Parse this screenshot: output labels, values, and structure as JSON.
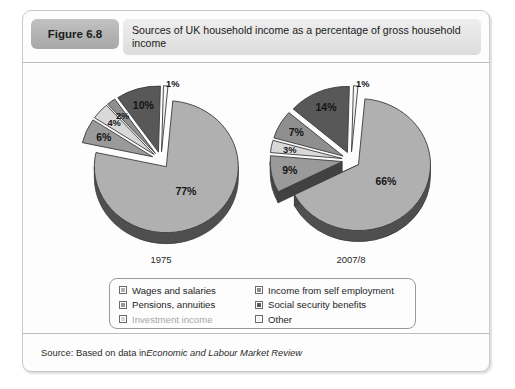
{
  "figure": {
    "badge_label": "Figure 6.8",
    "title": "Sources of UK household income as a percentage of gross household income",
    "source_prefix": "Source: Based on data in ",
    "source_italic": "Economic and Labour Market Review"
  },
  "legend": {
    "column1": [
      {
        "label": "Wages and salaries",
        "color": "#b0b0b0",
        "faint": false
      },
      {
        "label": "Pensions, annuities",
        "color": "#9a9a9a",
        "faint": false
      },
      {
        "label": "Investment income",
        "color": "#d8d8d8",
        "faint": true
      }
    ],
    "column2": [
      {
        "label": "Income from self employment",
        "color": "#8f8f8f",
        "faint": false
      },
      {
        "label": "Social security benefits",
        "color": "#585858",
        "faint": false
      },
      {
        "label": "Other",
        "color": "#f4f4f4",
        "faint": false
      }
    ]
  },
  "chart_data": {
    "type": "pie",
    "title": "Sources of UK household income as a percentage of gross household income",
    "unit": "%",
    "categories": [
      "Wages and salaries",
      "Pensions, annuities",
      "Investment income",
      "Income from self employment",
      "Social security benefits",
      "Other"
    ],
    "colors": [
      "#b0b0b0",
      "#9a9a9a",
      "#d8d8d8",
      "#8f8f8f",
      "#585858",
      "#f4f4f4"
    ],
    "series": [
      {
        "name": "1975",
        "values": [
          77,
          6,
          4,
          2,
          10,
          1
        ],
        "labels": [
          "77%",
          "6%",
          "4%",
          "2%",
          "10%",
          "1%"
        ]
      },
      {
        "name": "2007/8",
        "values": [
          66,
          9,
          3,
          7,
          14,
          1
        ],
        "labels": [
          "66%",
          "9%",
          "3%",
          "7%",
          "14%",
          "1%"
        ]
      }
    ],
    "legend_position": "bottom",
    "grid": false
  },
  "pies": [
    {
      "year_label": "1975",
      "slices": [
        {
          "label": "77%",
          "value": 77,
          "color": "#b0b0b0"
        },
        {
          "label": "6%",
          "value": 6,
          "color": "#9a9a9a"
        },
        {
          "label": "4%",
          "value": 4,
          "color": "#d8d8d8"
        },
        {
          "label": "2%",
          "value": 2,
          "color": "#8f8f8f"
        },
        {
          "label": "10%",
          "value": 10,
          "color": "#585858"
        },
        {
          "label": "1%",
          "value": 1,
          "color": "#f4f4f4"
        }
      ]
    },
    {
      "year_label": "2007/8",
      "slices": [
        {
          "label": "66%",
          "value": 66,
          "color": "#b0b0b0"
        },
        {
          "label": "9%",
          "value": 9,
          "color": "#9a9a9a"
        },
        {
          "label": "3%",
          "value": 3,
          "color": "#d8d8d8"
        },
        {
          "label": "7%",
          "value": 7,
          "color": "#8f8f8f"
        },
        {
          "label": "14%",
          "value": 14,
          "color": "#585858"
        },
        {
          "label": "1%",
          "value": 1,
          "color": "#f4f4f4"
        }
      ]
    }
  ]
}
